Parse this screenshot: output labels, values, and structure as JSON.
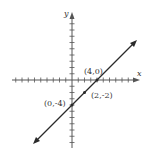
{
  "chart_data": {
    "type": "line",
    "title": "",
    "xlabel": "x",
    "ylabel": "y",
    "xlim": [
      -9,
      10
    ],
    "ylim": [
      -10,
      10
    ],
    "grid": false,
    "tick_step": 1,
    "series": [
      {
        "name": "line y = x - 4",
        "equation": "y = x - 4",
        "slope": 1,
        "intercept": -4,
        "x": [
          -6,
          10
        ],
        "y": [
          -10,
          6
        ]
      }
    ],
    "points": [
      {
        "label": "(4,0)",
        "x": 4,
        "y": 0
      },
      {
        "label": "(2,-2)",
        "x": 2,
        "y": -2
      },
      {
        "label": "(0,-4)",
        "x": 0,
        "y": -4
      }
    ]
  },
  "labels": {
    "x_axis": "x",
    "y_axis": "y",
    "point_a": "(4,0)",
    "point_b": "(2,-2)",
    "point_c": "(0,-4)"
  },
  "colors": {
    "axis": "#555555",
    "line": "#2a2a2a",
    "text": "#333333"
  }
}
